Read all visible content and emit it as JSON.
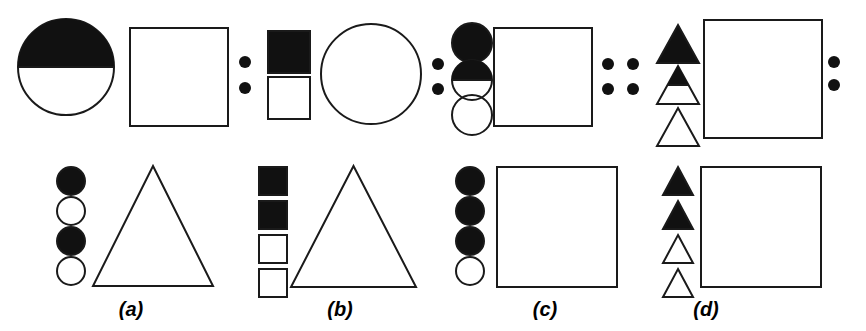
{
  "figure": {
    "type": "diagram",
    "background_color": "#ffffff",
    "stroke_color": "#1a1a1a",
    "fill_color": "#111111",
    "width": 866,
    "height": 331
  },
  "panels": [
    {
      "id": "a",
      "label": "(a)",
      "label_x": 131,
      "label_y": 298,
      "rows": [
        {
          "name": "top",
          "small_shapes": [
            {
              "shape": "circle",
              "fill": "half-top",
              "cx": 66,
              "cy": 67,
              "r": 48
            }
          ],
          "large_shape": {
            "shape": "square",
            "fill": "none",
            "x": 130,
            "y": 28,
            "size": 98
          }
        },
        {
          "name": "bottom",
          "small_shapes": [
            {
              "shape": "circle",
              "fill": "full",
              "cx": 71,
              "cy": 181,
              "r": 14
            },
            {
              "shape": "circle",
              "fill": "none",
              "cx": 71,
              "cy": 211,
              "r": 14
            },
            {
              "shape": "circle",
              "fill": "full",
              "cx": 71,
              "cy": 241,
              "r": 14
            },
            {
              "shape": "circle",
              "fill": "none",
              "cx": 71,
              "cy": 271,
              "r": 14
            }
          ],
          "large_shape": {
            "shape": "triangle",
            "fill": "none",
            "x": 93,
            "y": 166,
            "width": 120,
            "height": 120
          }
        }
      ]
    },
    {
      "id": "b",
      "label": "(b)",
      "label_x": 340,
      "label_y": 298,
      "rows": [
        {
          "name": "top",
          "small_shapes": [
            {
              "shape": "square",
              "fill": "full",
              "x": 268,
              "y": 31,
              "size": 42
            },
            {
              "shape": "square",
              "fill": "none",
              "x": 268,
              "y": 77,
              "size": 42
            }
          ],
          "large_shape": {
            "shape": "circle",
            "fill": "none",
            "cx": 371,
            "cy": 74,
            "r": 50
          }
        },
        {
          "name": "bottom",
          "small_shapes": [
            {
              "shape": "square",
              "fill": "full",
              "x": 259,
              "y": 167,
              "size": 28
            },
            {
              "shape": "square",
              "fill": "full",
              "x": 259,
              "y": 201,
              "size": 28
            },
            {
              "shape": "square",
              "fill": "none",
              "x": 259,
              "y": 235,
              "size": 28
            },
            {
              "shape": "square",
              "fill": "none",
              "x": 259,
              "y": 269,
              "size": 28
            }
          ],
          "large_shape": {
            "shape": "triangle",
            "fill": "none",
            "x": 291,
            "y": 166,
            "width": 125,
            "height": 121
          }
        }
      ]
    },
    {
      "id": "c",
      "label": "(c)",
      "label_x": 545,
      "label_y": 298,
      "rows": [
        {
          "name": "top",
          "small_shapes": [
            {
              "shape": "circle",
              "fill": "full",
              "cx": 472,
              "cy": 43,
              "r": 20
            },
            {
              "shape": "circle",
              "fill": "half-top",
              "cx": 472,
              "cy": 80,
              "r": 20
            },
            {
              "shape": "circle",
              "fill": "none",
              "cx": 472,
              "cy": 115,
              "r": 20
            }
          ],
          "large_shape": {
            "shape": "square",
            "fill": "none",
            "x": 494,
            "y": 28,
            "size": 98
          }
        },
        {
          "name": "bottom",
          "small_shapes": [
            {
              "shape": "circle",
              "fill": "full",
              "cx": 470,
              "cy": 181,
              "r": 14
            },
            {
              "shape": "circle",
              "fill": "full",
              "cx": 470,
              "cy": 211,
              "r": 14
            },
            {
              "shape": "circle",
              "fill": "full",
              "cx": 470,
              "cy": 241,
              "r": 14
            },
            {
              "shape": "circle",
              "fill": "none",
              "cx": 470,
              "cy": 271,
              "r": 14
            }
          ],
          "large_shape": {
            "shape": "square",
            "fill": "none",
            "x": 497,
            "y": 167,
            "size": 120
          }
        }
      ]
    },
    {
      "id": "d",
      "label": "(d)",
      "label_x": 706,
      "label_y": 298,
      "rows": [
        {
          "name": "top",
          "small_shapes": [
            {
              "shape": "triangle",
              "fill": "full",
              "x": 657,
              "y": 25,
              "width": 42,
              "height": 38
            },
            {
              "shape": "triangle",
              "fill": "half-top",
              "x": 657,
              "y": 66,
              "width": 42,
              "height": 38
            },
            {
              "shape": "triangle",
              "fill": "none",
              "x": 657,
              "y": 108,
              "width": 42,
              "height": 38
            }
          ],
          "large_shape": {
            "shape": "square",
            "fill": "none",
            "x": 704,
            "y": 20,
            "size": 118
          }
        },
        {
          "name": "bottom",
          "small_shapes": [
            {
              "shape": "triangle",
              "fill": "full",
              "x": 663,
              "y": 167,
              "width": 30,
              "height": 28
            },
            {
              "shape": "triangle",
              "fill": "full",
              "x": 663,
              "y": 201,
              "width": 30,
              "height": 28
            },
            {
              "shape": "triangle",
              "fill": "none",
              "x": 663,
              "y": 235,
              "width": 30,
              "height": 28
            },
            {
              "shape": "triangle",
              "fill": "none",
              "x": 663,
              "y": 269,
              "width": 30,
              "height": 28
            }
          ],
          "large_shape": {
            "shape": "square",
            "fill": "none",
            "x": 701,
            "y": 167,
            "size": 120
          }
        }
      ]
    }
  ],
  "separators": [
    {
      "name": "separator-a-b",
      "dots": [
        {
          "cx": 245,
          "cy": 62
        },
        {
          "cx": 245,
          "cy": 88
        }
      ],
      "r": 6
    },
    {
      "name": "separator-b-c",
      "dots": [
        {
          "cx": 438,
          "cy": 64
        },
        {
          "cx": 438,
          "cy": 89
        }
      ],
      "r": 6
    },
    {
      "name": "separator-c-d",
      "dots": [
        {
          "cx": 608,
          "cy": 64
        },
        {
          "cx": 633,
          "cy": 64
        },
        {
          "cx": 608,
          "cy": 89
        },
        {
          "cx": 633,
          "cy": 89
        }
      ],
      "r": 6
    },
    {
      "name": "separator-right-edge",
      "dots": [
        {
          "cx": 834,
          "cy": 62
        },
        {
          "cx": 834,
          "cy": 85
        }
      ],
      "r": 6
    }
  ]
}
